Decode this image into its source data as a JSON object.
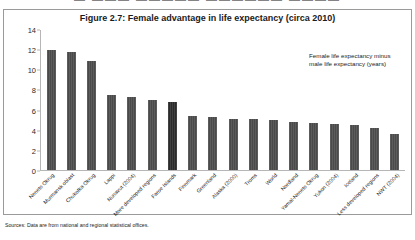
{
  "top_strip_text": "▬ ▬▬▬ ▬▬▬▬▬ ▬▬▬▬▬▬ ▬▬▬▬",
  "figure": {
    "title": "Figure 2.7: Female advantage in life expectancy (circa 2010)",
    "annotation_line1": "Female life expectancy minus",
    "annotation_line2": "male life expectancy (years)",
    "sources": "Sources: Data are from national and regional statistical offices."
  },
  "colors": {
    "bar": "#4a4a4a",
    "bar_highlight": "#2b2b2b",
    "axis": "#b6b6b6",
    "border": "#9a9a9a",
    "text": "#1b1b1b"
  },
  "chart_data": {
    "type": "bar",
    "title": "Figure 2.7: Female advantage in life expectancy (circa 2010)",
    "xlabel": "",
    "ylabel": "",
    "ylim": [
      0,
      14
    ],
    "yticks": [
      0,
      2,
      4,
      6,
      8,
      10,
      12,
      14
    ],
    "grid": false,
    "legend": "none",
    "annotation": "Female life expectancy minus male life expectancy (years)",
    "highlight_category": "Faroe Islands",
    "categories": [
      "Nenets Okrug",
      "Murmansk oblast",
      "Chukotka Okrug",
      "Lappi",
      "Nunavut (2004)",
      "More developed regions",
      "Faroe Islands",
      "Finnmark",
      "Greenland",
      "Alaska (2000)",
      "Troms",
      "World",
      "Nordland",
      "Yamal-Nenets Okrug",
      "Yukon (2004)",
      "Iceland",
      "Less developed regions",
      "NWT (2004)"
    ],
    "values": [
      12.0,
      11.8,
      10.9,
      7.5,
      7.3,
      7.0,
      6.8,
      5.4,
      5.3,
      5.1,
      5.1,
      5.0,
      4.8,
      4.7,
      4.6,
      4.5,
      4.2,
      3.6
    ]
  }
}
